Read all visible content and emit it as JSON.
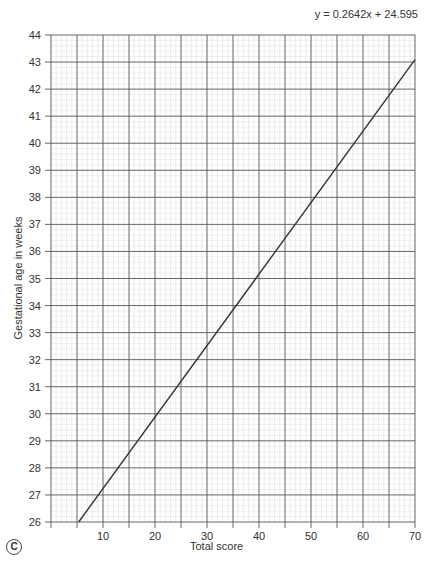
{
  "chart_data": {
    "type": "line",
    "title": "",
    "equation": "y = 0.2642x + 24.595",
    "xlabel": "Total score",
    "ylabel": "Gestational age in weeks",
    "xlim": [
      0,
      70
    ],
    "ylim": [
      26,
      44
    ],
    "x_ticks": [
      10,
      20,
      30,
      40,
      50,
      60,
      70
    ],
    "y_ticks": [
      26,
      27,
      28,
      29,
      30,
      31,
      32,
      33,
      34,
      35,
      36,
      37,
      38,
      39,
      40,
      41,
      42,
      43,
      44
    ],
    "grid": true,
    "series": [
      {
        "name": "regression",
        "x": [
          5.32,
          70
        ],
        "y": [
          26,
          43.09
        ]
      }
    ],
    "panel_label": "C"
  }
}
